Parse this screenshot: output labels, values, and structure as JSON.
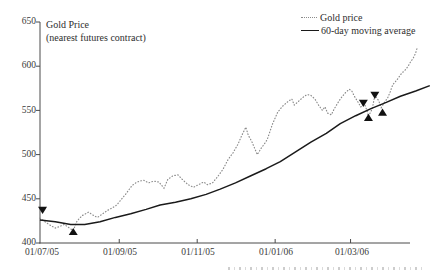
{
  "title": {
    "line1": "Gold Price",
    "line2": "(nearest futures contract)"
  },
  "legend": {
    "items": [
      {
        "label": "Gold price",
        "style": "dotted"
      },
      {
        "label": "60-day moving average",
        "style": "solid"
      }
    ],
    "position": "top-right"
  },
  "colors": {
    "background": "#ffffff",
    "gold_price_line": "#8c8c8c",
    "moving_average_line": "#1a1a1a",
    "axis": "#4a4a4a",
    "text": "#2e2e2e",
    "signal_marker": "#111111"
  },
  "chart_data": {
    "type": "line",
    "title": "Gold Price (nearest futures contract)",
    "grid": false,
    "legend_position": "top-right",
    "x_axis": {
      "unit": "days since 01/07/05",
      "tick_labels": [
        "01/07/05",
        "01/09/05",
        "01/11/05",
        "01/01/06",
        "01/03/06"
      ],
      "tick_days": [
        0,
        62,
        123,
        184,
        243
      ],
      "domain_days": [
        0,
        305
      ]
    },
    "y_axis": {
      "min": 400,
      "max": 650,
      "tick_step": 50,
      "tick_labels": [
        "650",
        "600",
        "550",
        "500",
        "450",
        "400"
      ],
      "tick_values": [
        650,
        600,
        550,
        500,
        450,
        400
      ]
    },
    "series": [
      {
        "name": "Gold price",
        "style": "dotted",
        "color": "#8c8c8c",
        "points": [
          [
            0,
            428
          ],
          [
            4,
            424
          ],
          [
            8,
            420
          ],
          [
            12,
            417
          ],
          [
            16,
            419
          ],
          [
            19,
            421
          ],
          [
            22,
            418
          ],
          [
            26,
            414
          ],
          [
            29,
            425
          ],
          [
            33,
            431
          ],
          [
            38,
            435
          ],
          [
            42,
            431
          ],
          [
            45,
            429
          ],
          [
            49,
            433
          ],
          [
            53,
            437
          ],
          [
            57,
            440
          ],
          [
            60,
            443
          ],
          [
            64,
            450
          ],
          [
            68,
            457
          ],
          [
            72,
            465
          ],
          [
            76,
            469
          ],
          [
            81,
            471
          ],
          [
            85,
            468
          ],
          [
            89,
            470
          ],
          [
            93,
            469
          ],
          [
            97,
            462
          ],
          [
            100,
            472
          ],
          [
            104,
            476
          ],
          [
            108,
            477
          ],
          [
            112,
            471
          ],
          [
            116,
            466
          ],
          [
            120,
            463
          ],
          [
            124,
            466
          ],
          [
            128,
            469
          ],
          [
            131,
            466
          ],
          [
            135,
            468
          ],
          [
            139,
            475
          ],
          [
            143,
            483
          ],
          [
            147,
            494
          ],
          [
            151,
            502
          ],
          [
            155,
            512
          ],
          [
            158,
            522
          ],
          [
            161,
            531
          ],
          [
            163,
            522
          ],
          [
            166,
            514
          ],
          [
            168,
            507
          ],
          [
            170,
            500
          ],
          [
            173,
            507
          ],
          [
            177,
            515
          ],
          [
            178,
            518
          ],
          [
            182,
            535
          ],
          [
            186,
            548
          ],
          [
            190,
            555
          ],
          [
            194,
            560
          ],
          [
            197,
            563
          ],
          [
            199,
            556
          ],
          [
            202,
            560
          ],
          [
            206,
            565
          ],
          [
            209,
            568
          ],
          [
            212,
            567
          ],
          [
            215,
            563
          ],
          [
            218,
            556
          ],
          [
            221,
            550
          ],
          [
            223,
            554
          ],
          [
            225,
            547
          ],
          [
            228,
            545
          ],
          [
            230,
            551
          ],
          [
            232,
            556
          ],
          [
            235,
            563
          ],
          [
            239,
            570
          ],
          [
            242,
            574
          ],
          [
            244,
            572
          ],
          [
            246,
            566
          ],
          [
            249,
            559
          ],
          [
            251,
            554
          ],
          [
            254,
            557
          ],
          [
            256,
            549
          ],
          [
            257,
            543
          ],
          [
            260,
            552
          ],
          [
            262,
            567
          ],
          [
            265,
            561
          ],
          [
            267,
            553
          ],
          [
            269,
            558
          ],
          [
            272,
            564
          ],
          [
            274,
            571
          ],
          [
            276,
            579
          ],
          [
            279,
            584
          ],
          [
            281,
            588
          ],
          [
            283,
            592
          ],
          [
            286,
            596
          ],
          [
            288,
            600
          ],
          [
            290,
            605
          ],
          [
            292,
            609
          ],
          [
            294,
            615
          ],
          [
            295,
            620
          ]
        ]
      },
      {
        "name": "60-day moving average",
        "style": "solid",
        "color": "#1a1a1a",
        "points": [
          [
            0,
            426
          ],
          [
            12,
            424
          ],
          [
            24,
            421
          ],
          [
            35,
            421
          ],
          [
            47,
            424
          ],
          [
            59,
            429
          ],
          [
            71,
            433
          ],
          [
            83,
            438
          ],
          [
            94,
            443
          ],
          [
            106,
            446
          ],
          [
            118,
            450
          ],
          [
            130,
            455
          ],
          [
            141,
            461
          ],
          [
            153,
            468
          ],
          [
            165,
            476
          ],
          [
            177,
            484
          ],
          [
            188,
            492
          ],
          [
            200,
            503
          ],
          [
            212,
            514
          ],
          [
            224,
            524
          ],
          [
            235,
            535
          ],
          [
            247,
            544
          ],
          [
            259,
            552
          ],
          [
            271,
            559
          ],
          [
            282,
            566
          ],
          [
            294,
            572
          ],
          [
            305,
            578
          ]
        ]
      }
    ],
    "signals": [
      {
        "day": 2,
        "value": 437,
        "type": "sell",
        "shape": "down-triangle"
      },
      {
        "day": 26,
        "value": 413,
        "type": "buy",
        "shape": "up-triangle"
      },
      {
        "day": 253,
        "value": 558,
        "type": "sell",
        "shape": "down-triangle"
      },
      {
        "day": 257,
        "value": 542,
        "type": "buy",
        "shape": "up-triangle"
      },
      {
        "day": 262,
        "value": 567,
        "type": "sell",
        "shape": "down-triangle"
      },
      {
        "day": 268,
        "value": 548,
        "type": "buy",
        "shape": "up-triangle"
      }
    ]
  }
}
